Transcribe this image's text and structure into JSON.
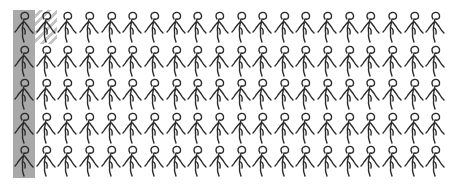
{
  "chart_data": {
    "type": "pictogram",
    "title": "",
    "icon": "person-icon",
    "grid": {
      "rows": 5,
      "columns": 20
    },
    "total_icons": 100,
    "highlighted_full": 5,
    "highlighted_partial": 1,
    "highlighted_value_approx": 5.5,
    "fill_order": "column-major",
    "series": [
      {
        "name": "highlighted",
        "value": 5.5,
        "color": "#a9a9a9",
        "style": "solid gray background; partial unit shown hatched"
      },
      {
        "name": "remaining",
        "value": 94.5,
        "color": "#ffffff"
      }
    ],
    "xlabel": "",
    "ylabel": "",
    "legend": "none"
  },
  "colors": {
    "full_fill": "#a9a9a9",
    "partial_hatch": "#c4c4c4",
    "icon_stroke": "#2b2b2b",
    "background": "#ffffff"
  }
}
